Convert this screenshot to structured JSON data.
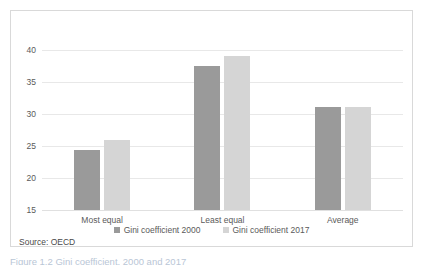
{
  "chart_data": {
    "type": "bar",
    "title": "",
    "xlabel": "",
    "ylabel": "",
    "categories": [
      "Most equal",
      "Least equal",
      "Average"
    ],
    "series": [
      {
        "name": "Gini coefficient 2000",
        "color": "#9a9a9a",
        "values": [
          24.4,
          37.5,
          31.1
        ]
      },
      {
        "name": "Gini coefficient 2017",
        "color": "#d5d5d5",
        "values": [
          26.0,
          39.1,
          31.1
        ]
      }
    ],
    "ylim": [
      15,
      40
    ],
    "yticks": [
      40,
      35,
      30,
      25,
      20,
      15
    ],
    "grid": true,
    "legend_position": "bottom"
  },
  "source_note": "Source: OECD",
  "caption": "Figure 1.2  Gini coefficient, 2000 and 2017",
  "colors": {
    "series_2000": "#9a9a9a",
    "series_2017": "#d5d5d5",
    "gridline": "#e8e8e8",
    "frame": "#d9d9d9",
    "text": "#5a5a5a"
  }
}
